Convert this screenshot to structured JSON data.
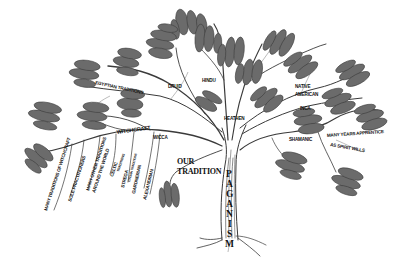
{
  "diagram": {
    "type": "tree",
    "root": {
      "label": "PAGANISM",
      "letters": [
        "P",
        "A",
        "G",
        "A",
        "N",
        "I",
        "S",
        "M"
      ]
    },
    "colors": {
      "background": "#ffffff",
      "ink": "#111111",
      "foliage": "#6b6b6b",
      "bark": "#3a3a3a"
    },
    "branches": {
      "egyptian": {
        "label": "EGYPTIAN TRADITIONS"
      },
      "druid": {
        "label": "DRUID"
      },
      "hindu": {
        "label": "HINDU"
      },
      "heathen": {
        "label": "HEATHEN"
      },
      "native_american": {
        "label_line1": "NATIVE",
        "label_line2": "AMERICAN"
      },
      "inca": {
        "label": "INCA"
      },
      "shamanic": {
        "label": "SHAMANIC",
        "children": [
          {
            "label": "MANY YEARS APPRENTICE"
          },
          {
            "label": "AS SPIRIT WILLS"
          }
        ]
      },
      "witchcraft": {
        "label": "WITCHCRAFT",
        "children": [
          {
            "label": "MANY TRADITIONS OF WITCHCRAFT"
          },
          {
            "label": "SOLE PRACTITIONERS"
          },
          {
            "label_line1": "MANY OTHER TRADITIONS",
            "label_line2": "AROUND THE WORLD"
          },
          {
            "label_line1": "CELTIC",
            "label_line2": "TRADITIONS"
          },
          {
            "label_line1": "STREGA",
            "label_line2": "ITALIAN TRADITIONS"
          },
          {
            "label": "GARDNERIAN"
          },
          {
            "label": "ALEXANDRIAN"
          }
        ]
      },
      "wicca": {
        "label": "WICCA"
      },
      "our_tradition": {
        "label_line1": "OUR",
        "label_line2": "TRADITION"
      }
    }
  }
}
